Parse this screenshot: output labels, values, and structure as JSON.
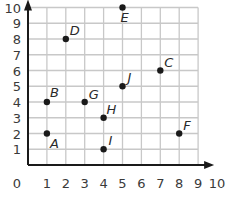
{
  "chart_data": {
    "type": "scatter",
    "title": "",
    "xlabel": "",
    "ylabel": "",
    "xlim": [
      0,
      10
    ],
    "ylim": [
      0,
      10
    ],
    "grid": true,
    "x_ticks": [
      0,
      1,
      2,
      3,
      4,
      5,
      6,
      7,
      8,
      9,
      10
    ],
    "y_ticks": [
      1,
      2,
      3,
      4,
      5,
      6,
      7,
      8,
      9,
      10
    ],
    "points": [
      {
        "label": "A",
        "x": 1,
        "y": 2
      },
      {
        "label": "B",
        "x": 1,
        "y": 4
      },
      {
        "label": "C",
        "x": 7,
        "y": 6
      },
      {
        "label": "D",
        "x": 2,
        "y": 8
      },
      {
        "label": "E",
        "x": 5,
        "y": 10
      },
      {
        "label": "F",
        "x": 8,
        "y": 2
      },
      {
        "label": "G",
        "x": 3,
        "y": 4
      },
      {
        "label": "H",
        "x": 4,
        "y": 3
      },
      {
        "label": "I",
        "x": 4,
        "y": 1
      },
      {
        "label": "J",
        "x": 5,
        "y": 5
      }
    ],
    "colors": {
      "grid": "#c8c8c8",
      "axis": "#1a1a1a",
      "point": "#1a1a1a"
    }
  }
}
